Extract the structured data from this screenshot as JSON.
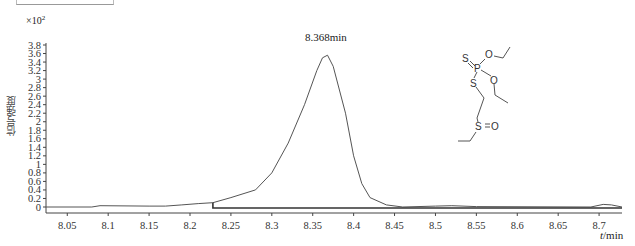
{
  "header": {
    "cut_title": ""
  },
  "chart_data": {
    "type": "line",
    "title": "",
    "xlabel": "t/min",
    "ylabel": "信号强度",
    "y_multiplier": "×10²",
    "xlim": [
      8.024,
      8.728
    ],
    "ylim": [
      0,
      3.8
    ],
    "grid": false,
    "x_ticks": [
      "8.05",
      "8.1",
      "8.15",
      "8.2",
      "8.25",
      "8.3",
      "8.35",
      "8.4",
      "8.45",
      "8.5",
      "8.55",
      "8.6",
      "8.65",
      "8.7"
    ],
    "y_ticks": [
      "0",
      "0.2",
      "0.4",
      "0.6",
      "0.8",
      "1",
      "1.2",
      "1.4",
      "1.6",
      "1.8",
      "2",
      "2.2",
      "2.4",
      "2.6",
      "2.8",
      "3",
      "3.2",
      "3.4",
      "3.6",
      "3.8"
    ],
    "annotations": [
      {
        "text": "8.368min",
        "x": 8.368,
        "y": 3.56
      }
    ],
    "series": [
      {
        "name": "chromatogram",
        "x": [
          8.024,
          8.08,
          8.09,
          8.15,
          8.17,
          8.19,
          8.21,
          8.228,
          8.25,
          8.28,
          8.3,
          8.32,
          8.34,
          8.355,
          8.362,
          8.368,
          8.375,
          8.39,
          8.4,
          8.41,
          8.42,
          8.44,
          8.46,
          8.5,
          8.52,
          8.55,
          8.69,
          8.705,
          8.715,
          8.728
        ],
        "values": [
          0.0,
          0.0,
          0.03,
          0.02,
          0.02,
          0.05,
          0.08,
          0.1,
          0.22,
          0.4,
          0.8,
          1.5,
          2.4,
          3.2,
          3.5,
          3.56,
          3.3,
          2.2,
          1.2,
          0.55,
          0.22,
          0.05,
          0.0,
          0.02,
          0.03,
          0.01,
          0.0,
          0.06,
          0.05,
          0.0
        ]
      }
    ],
    "baseline": {
      "x_start": 8.228,
      "x_end": 8.728,
      "value": 0.0
    }
  },
  "structure": {
    "atoms": {
      "S1": "S",
      "P": "P",
      "O1": "O",
      "O2": "O",
      "S2": "S",
      "S3": "S",
      "O3": "O"
    },
    "name": "Oxydemeton-type phosphorodithioate sulfoxide"
  },
  "labels": {
    "y_exp_base": "×10",
    "y_exp_power": "2",
    "x_unit_t": "t",
    "x_unit_rest": "/min"
  }
}
